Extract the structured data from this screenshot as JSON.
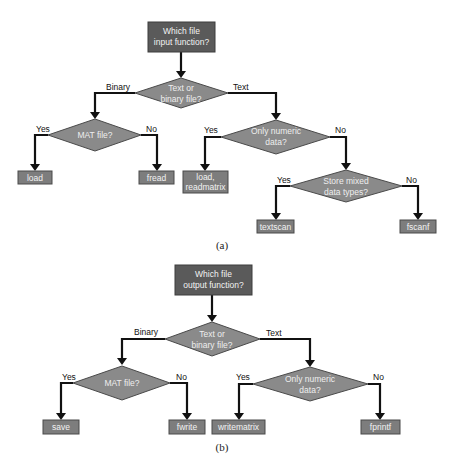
{
  "diagram_a": {
    "start": {
      "line1": "Which file",
      "line2": "input function?"
    },
    "decision_type": {
      "line1": "Text or",
      "line2": "binary file?"
    },
    "branch_binary": "Binary",
    "branch_text": "Text",
    "decision_mat": {
      "line1": "MAT file?"
    },
    "mat_yes": "Yes",
    "mat_no": "No",
    "out_load": "load",
    "out_fread": "fread",
    "decision_numeric": {
      "line1": "Only numeric",
      "line2": "data?"
    },
    "numeric_yes": "Yes",
    "numeric_no": "No",
    "out_load_readmatrix": {
      "line1": "load,",
      "line2": "readmatrix"
    },
    "decision_mixed": {
      "line1": "Store mixed",
      "line2": "data types?"
    },
    "mixed_yes": "Yes",
    "mixed_no": "No",
    "out_textscan": "textscan",
    "out_fscanf": "fscanf",
    "caption": "(a)"
  },
  "diagram_b": {
    "start": {
      "line1": "Which file",
      "line2": "output function?"
    },
    "decision_type": {
      "line1": "Text or",
      "line2": "binary file?"
    },
    "branch_binary": "Binary",
    "branch_text": "Text",
    "decision_mat": {
      "line1": "MAT file?"
    },
    "mat_yes": "Yes",
    "mat_no": "No",
    "out_save": "save",
    "out_fwrite": "fwrite",
    "decision_numeric": {
      "line1": "Only numeric",
      "line2": "data?"
    },
    "numeric_yes": "Yes",
    "numeric_no": "No",
    "out_writematrix": "writematrix",
    "out_fprintf": "fprintf",
    "caption": "(b)"
  },
  "colors": {
    "start_box": "#5a5a5a",
    "decision": "#8a8a8a",
    "end_box": "#7d7d7d",
    "arrow": "#111111"
  }
}
